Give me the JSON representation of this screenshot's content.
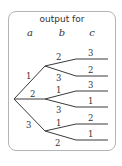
{
  "header": {
    "title": "output for",
    "columns": [
      "a",
      "b",
      "c"
    ]
  },
  "tree": {
    "root": {
      "x": 14,
      "y": 99
    },
    "branches": [
      {
        "label": "1",
        "node": {
          "x": 45,
          "y": 66
        },
        "children": [
          {
            "label": "2",
            "leaf_label": "3",
            "y": 59
          },
          {
            "label": "3",
            "leaf_label": "2",
            "y": 76
          }
        ]
      },
      {
        "label": "2",
        "node": {
          "x": 45,
          "y": 99
        },
        "children": [
          {
            "label": "1",
            "leaf_label": "3",
            "y": 91
          },
          {
            "label": "3",
            "leaf_label": "1",
            "y": 107
          }
        ]
      },
      {
        "label": "3",
        "node": {
          "x": 45,
          "y": 131
        },
        "children": [
          {
            "label": "1",
            "leaf_label": "2",
            "y": 124
          },
          {
            "label": "2",
            "leaf_label": "1",
            "y": 140
          }
        ]
      }
    ]
  }
}
